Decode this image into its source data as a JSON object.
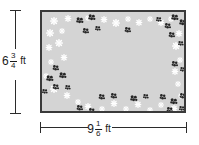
{
  "figure": {
    "type": "geometry-diagram",
    "shape": "rectangle"
  },
  "dimensions": {
    "height": {
      "whole": "6",
      "numerator": "3",
      "denominator": "4",
      "unit": "ft",
      "full_text": "6 3/4 ft",
      "value": 6.75,
      "orientation": "vertical",
      "position": "left"
    },
    "width": {
      "whole": "9",
      "numerator": "1",
      "denominator": "6",
      "unit": "ft",
      "full_text": "9 1/6 ft",
      "value": 9.1667,
      "orientation": "horizontal",
      "position": "bottom"
    }
  },
  "colors": {
    "border": "#3a3a3a",
    "fill": "#d4d4d4",
    "dimension_line": "#2b2b2b",
    "text": "#1a1a1a",
    "daisy": "#ffffff",
    "cluster": "#262626",
    "background": "#ffffff"
  },
  "decorations": {
    "daisy_label": "white-daisy-flower",
    "cluster_label": "dark-flower-cluster",
    "daisies": [
      {
        "x": 12,
        "y": 8,
        "s": 8
      },
      {
        "x": 26,
        "y": 5,
        "s": 7
      },
      {
        "x": 8,
        "y": 20,
        "s": 8
      },
      {
        "x": 20,
        "y": 17,
        "s": 6
      },
      {
        "x": 62,
        "y": 6,
        "s": 7
      },
      {
        "x": 74,
        "y": 10,
        "s": 8
      },
      {
        "x": 86,
        "y": 5,
        "s": 6
      },
      {
        "x": 97,
        "y": 9,
        "s": 7
      },
      {
        "x": 108,
        "y": 5,
        "s": 6
      },
      {
        "x": 119,
        "y": 9,
        "s": 7
      },
      {
        "x": 129,
        "y": 5,
        "s": 6
      },
      {
        "x": 7,
        "y": 34,
        "s": 7
      },
      {
        "x": 17,
        "y": 30,
        "s": 8
      },
      {
        "x": 9,
        "y": 48,
        "s": 6
      },
      {
        "x": 22,
        "y": 44,
        "s": 7
      },
      {
        "x": 12,
        "y": 76,
        "s": 8
      },
      {
        "x": 25,
        "y": 82,
        "s": 7
      },
      {
        "x": 36,
        "y": 88,
        "s": 6
      },
      {
        "x": 46,
        "y": 93,
        "s": 7
      },
      {
        "x": 60,
        "y": 95,
        "s": 6
      },
      {
        "x": 72,
        "y": 90,
        "s": 7
      },
      {
        "x": 84,
        "y": 95,
        "s": 6
      },
      {
        "x": 96,
        "y": 91,
        "s": 7
      },
      {
        "x": 108,
        "y": 96,
        "s": 6
      },
      {
        "x": 119,
        "y": 91,
        "s": 6
      },
      {
        "x": 132,
        "y": 95,
        "s": 7
      },
      {
        "x": 137,
        "y": 20,
        "s": 7
      },
      {
        "x": 134,
        "y": 33,
        "s": 8
      },
      {
        "x": 138,
        "y": 46,
        "s": 6
      },
      {
        "x": 133,
        "y": 58,
        "s": 7
      },
      {
        "x": 136,
        "y": 70,
        "s": 6
      },
      {
        "x": 139,
        "y": 82,
        "s": 6
      },
      {
        "x": 46,
        "y": 4,
        "s": 6
      },
      {
        "x": 4,
        "y": 62,
        "s": 6
      }
    ],
    "clusters": [
      {
        "x": 38,
        "y": 8,
        "s": 9
      },
      {
        "x": 50,
        "y": 5,
        "s": 9
      },
      {
        "x": 44,
        "y": 18,
        "s": 8
      },
      {
        "x": 56,
        "y": 15,
        "s": 7
      },
      {
        "x": 86,
        "y": 17,
        "s": 8
      },
      {
        "x": 14,
        "y": 55,
        "s": 8
      },
      {
        "x": 8,
        "y": 66,
        "s": 9
      },
      {
        "x": 21,
        "y": 63,
        "s": 9
      },
      {
        "x": 14,
        "y": 74,
        "s": 8
      },
      {
        "x": 26,
        "y": 74,
        "s": 7
      },
      {
        "x": 3,
        "y": 78,
        "s": 7
      },
      {
        "x": 38,
        "y": 95,
        "s": 8
      },
      {
        "x": 50,
        "y": 98,
        "s": 8
      },
      {
        "x": 60,
        "y": 84,
        "s": 8
      },
      {
        "x": 72,
        "y": 83,
        "s": 8
      },
      {
        "x": 92,
        "y": 86,
        "s": 9
      },
      {
        "x": 104,
        "y": 83,
        "s": 7
      },
      {
        "x": 117,
        "y": 6,
        "s": 7
      },
      {
        "x": 126,
        "y": 13,
        "s": 8
      },
      {
        "x": 133,
        "y": 5,
        "s": 9
      },
      {
        "x": 141,
        "y": 10,
        "s": 9
      },
      {
        "x": 130,
        "y": 22,
        "s": 8
      },
      {
        "x": 139,
        "y": 30,
        "s": 7
      },
      {
        "x": 133,
        "y": 51,
        "s": 8
      },
      {
        "x": 141,
        "y": 56,
        "s": 7
      },
      {
        "x": 121,
        "y": 84,
        "s": 8
      },
      {
        "x": 132,
        "y": 89,
        "s": 9
      },
      {
        "x": 141,
        "y": 83,
        "s": 8
      },
      {
        "x": 128,
        "y": 97,
        "s": 8
      },
      {
        "x": 140,
        "y": 95,
        "s": 7
      }
    ]
  }
}
